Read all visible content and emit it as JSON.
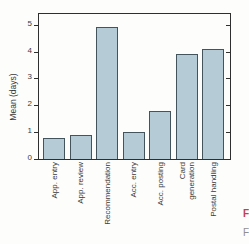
{
  "chart_data": {
    "type": "bar",
    "title": "",
    "categories": [
      "App. entry",
      "App. review",
      "Recommendation",
      "Acc. entry",
      "Acc. posting",
      "Card\ngeneration",
      "Postal handling"
    ],
    "values": [
      0.8,
      0.9,
      4.9,
      1.0,
      1.8,
      3.9,
      4.1
    ],
    "xlabel": "",
    "ylabel": "Mean (days)",
    "yticks": [
      0,
      1,
      2,
      3,
      4,
      5
    ],
    "ylim": [
      0,
      5.4
    ],
    "grid": false,
    "legend": null,
    "colors": {
      "bar_fill": "#b5ccd7",
      "bar_border": "#44545c",
      "frame": "#2f2f2f",
      "text": "#3a3a3a"
    }
  },
  "figure": {
    "caption_marker": "F",
    "caption_fragment": "F",
    "caption_color": "#c23f4e"
  }
}
